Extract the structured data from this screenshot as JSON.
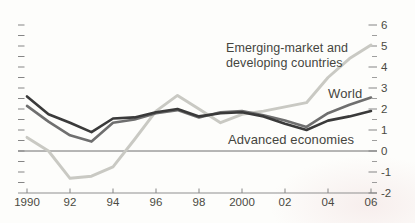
{
  "chart_data": {
    "type": "line",
    "title": "",
    "xlabel": "",
    "ylabel": "",
    "grid": false,
    "legend_position": "annotations-on-chart",
    "xlim": [
      1990,
      2006
    ],
    "ylim": [
      -2,
      6
    ],
    "y_major_step": 1,
    "y_minor_step": 0.5,
    "x": [
      1990,
      1991,
      1992,
      1993,
      1994,
      1995,
      1996,
      1997,
      1998,
      1999,
      2000,
      2001,
      2002,
      2003,
      2004,
      2005,
      2006
    ],
    "x_ticks": [
      {
        "year": 1990,
        "label": "1990"
      },
      {
        "year": 1992,
        "label": "92"
      },
      {
        "year": 1994,
        "label": "94"
      },
      {
        "year": 1996,
        "label": "96"
      },
      {
        "year": 1998,
        "label": "98"
      },
      {
        "year": 2000,
        "label": "2000"
      },
      {
        "year": 2002,
        "label": "02"
      },
      {
        "year": 2004,
        "label": "04"
      },
      {
        "year": 2006,
        "label": "06"
      }
    ],
    "y_ticks": [
      {
        "value": 6,
        "label": "6"
      },
      {
        "value": 5,
        "label": "5"
      },
      {
        "value": 4,
        "label": "4"
      },
      {
        "value": 3,
        "label": "3"
      },
      {
        "value": 2,
        "label": "2"
      },
      {
        "value": 1,
        "label": "1"
      },
      {
        "value": 0,
        "label": "0"
      },
      {
        "value": -1,
        "label": "-1"
      },
      {
        "value": -2,
        "label": "-2"
      }
    ],
    "series": [
      {
        "name": "Emerging-market and developing countries",
        "color": "#c9c9c3",
        "values": [
          0.65,
          0.0,
          -1.3,
          -1.2,
          -0.75,
          0.55,
          1.9,
          2.65,
          2.0,
          1.35,
          1.75,
          1.9,
          2.1,
          2.3,
          3.5,
          4.4,
          5.05
        ]
      },
      {
        "name": "World",
        "color": "#6f6f6f",
        "values": [
          2.15,
          1.4,
          0.75,
          0.45,
          1.35,
          1.5,
          1.8,
          1.95,
          1.6,
          1.85,
          1.9,
          1.7,
          1.45,
          1.15,
          1.8,
          2.2,
          2.55
        ]
      },
      {
        "name": "Advanced economies",
        "color": "#3a3a3a",
        "values": [
          2.6,
          1.75,
          1.35,
          0.9,
          1.55,
          1.6,
          1.85,
          2.0,
          1.65,
          1.8,
          1.85,
          1.65,
          1.3,
          1.0,
          1.45,
          1.65,
          1.9
        ]
      }
    ],
    "annotations": {
      "emerging": {
        "text": "Emerging-market and\ndeveloping countries"
      },
      "world": {
        "text": "World"
      },
      "advanced": {
        "text": "Advanced economies"
      }
    },
    "axis_colors": {
      "axis_line": "#8f8f8f",
      "zero_line": "#6e6e6e",
      "tick": "#858585",
      "label_text": "#4a4a42"
    }
  }
}
